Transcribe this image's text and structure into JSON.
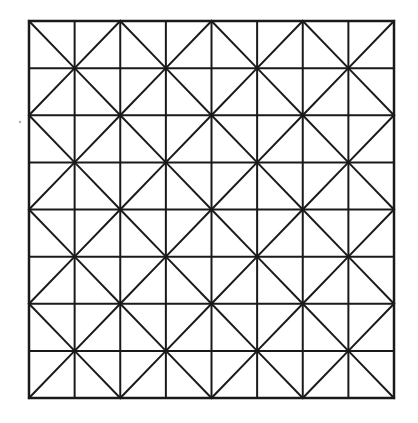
{
  "diagram": {
    "type": "square-grid-with-diagonal-lattice",
    "rows": 8,
    "cols": 8,
    "bounds": {
      "x0": 29,
      "y0": 21,
      "x1": 394,
      "y1": 398
    },
    "stroke_color": "#1a1a1a",
    "stroke_width": 2,
    "diagonal_block_size": 2,
    "stray_mark": {
      "x": 20,
      "y": 122,
      "r": 1.2,
      "color": "#b0b0b0"
    }
  }
}
